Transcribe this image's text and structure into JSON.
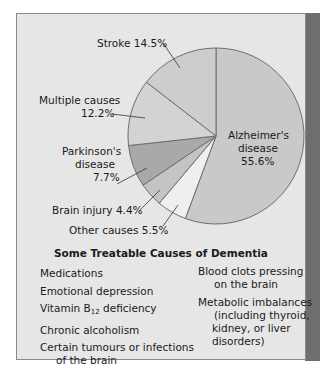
{
  "chart_data": {
    "type": "pie",
    "title": "",
    "start_angle": "12 o'clock, clockwise",
    "slices": [
      {
        "label": "Alzheimer's disease",
        "value": 55.6,
        "color": "#c9c9c9"
      },
      {
        "label": "Other causes",
        "value": 5.5,
        "color": "#efefef"
      },
      {
        "label": "Brain injury",
        "value": 4.4,
        "color": "#c4c4c4"
      },
      {
        "label": "Parkinson's disease",
        "value": 7.7,
        "color": "#a9a9a9"
      },
      {
        "label": "Multiple causes",
        "value": 12.2,
        "color": "#d3d3d3"
      },
      {
        "label": "Stroke",
        "value": 14.5,
        "color": "#cdcdcd"
      }
    ],
    "unit": "%"
  },
  "labels": {
    "stroke": "Stroke  14.5%",
    "multiple_line1": "Multiple causes",
    "multiple_line2": "12.2%",
    "parkinsons_line1": "Parkinson's",
    "parkinsons_line2": "disease",
    "parkinsons_line3": "7.7%",
    "brain_injury": "Brain injury  4.4%",
    "other": "Other causes  5.5%",
    "alz_line1": "Alzheimer's",
    "alz_line2": "disease",
    "alz_line3": "55.6%"
  },
  "treatable": {
    "title": "Some Treatable Causes of Dementia",
    "left": {
      "item1": "Medications",
      "item2": "Emotional depression",
      "item3_pre": "Vitamin B",
      "item3_sub": "12",
      "item3_post": " deficiency",
      "item4": "Chronic alcoholism",
      "item5_line1": "Certain tumours or infections",
      "item5_line2": "of the brain"
    },
    "right": {
      "item1_line1": "Blood clots pressing",
      "item1_line2": "on the brain",
      "item2_line1": "Metabolic imbalances",
      "item2_line2": "(including thyroid,",
      "item2_line3": "kidney, or liver",
      "item2_line4": "disorders)"
    }
  }
}
